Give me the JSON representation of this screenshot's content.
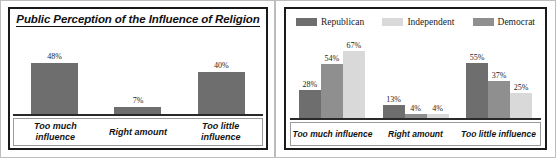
{
  "colors": {
    "republican": "#6e6e6e",
    "democrat": "#8f8f8f",
    "independent": "#d9d9d9",
    "bar_single": "#6e6e6e",
    "frame": "#1a1a1a",
    "axis": "#2a2a2a",
    "text": "#141414"
  },
  "left_panel": {
    "title": "Public Perception of the Influence of Religion"
  },
  "right_panel": {
    "legend": [
      {
        "label": "Republican",
        "color": "#6e6e6e"
      },
      {
        "label": "Independent",
        "color": "#d9d9d9"
      },
      {
        "label": "Democrat",
        "color": "#8f8f8f"
      }
    ]
  },
  "chart_data": [
    {
      "id": "left",
      "type": "bar",
      "title": "Public Perception of the Influence of Religion",
      "xlabel": "",
      "ylabel": "",
      "ylim": [
        0,
        70
      ],
      "grid": false,
      "legend": "none",
      "categories": [
        "Too much influence",
        "Right amount",
        "Too little influence"
      ],
      "category_lines": [
        [
          "Too much",
          "influence"
        ],
        [
          "Right amount",
          ""
        ],
        [
          "Too little",
          "influence"
        ]
      ],
      "values": [
        48,
        7,
        40
      ],
      "data_labels": [
        "48%",
        "7%",
        "40%"
      ],
      "bar_color": "#6e6e6e"
    },
    {
      "id": "right",
      "type": "bar",
      "title": "",
      "xlabel": "",
      "ylabel": "",
      "ylim": [
        0,
        75
      ],
      "grid": false,
      "legend": "top",
      "categories": [
        "Too much influence",
        "Right amount",
        "Too little influence"
      ],
      "series": [
        {
          "name": "Republican",
          "color": "#6e6e6e",
          "values": [
            28,
            13,
            55
          ],
          "labels": [
            "28%",
            "13%",
            "55%"
          ]
        },
        {
          "name": "Democrat",
          "color": "#8f8f8f",
          "values": [
            54,
            4,
            37
          ],
          "labels": [
            "54%",
            "4%",
            "37%"
          ]
        },
        {
          "name": "Independent",
          "color": "#d9d9d9",
          "values": [
            67,
            4,
            25
          ],
          "labels": [
            "67%",
            "4%",
            "25%"
          ]
        }
      ]
    }
  ]
}
